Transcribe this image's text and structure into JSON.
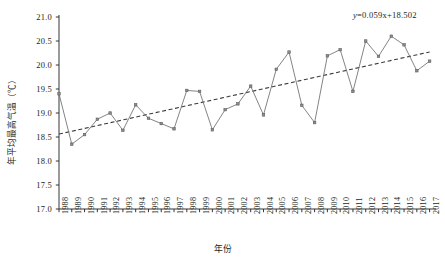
{
  "chart_data": {
    "type": "line",
    "title": "",
    "xlabel": "年份",
    "ylabel": "年平均最高气温（℃）",
    "ylim": [
      17.0,
      21.0
    ],
    "yticks": [
      "17.0",
      "17.5",
      "18.0",
      "18.5",
      "19.0",
      "19.5",
      "20.0",
      "20.5",
      "21.0"
    ],
    "ytick_values": [
      17.0,
      17.5,
      18.0,
      18.5,
      19.0,
      19.5,
      20.0,
      20.5,
      21.0
    ],
    "grid": false,
    "legend": false,
    "annotations": [
      {
        "name": "trend-equation",
        "text": "y=0.059x+18.502",
        "slope": 0.059,
        "intercept": 18.502
      }
    ],
    "categories": [
      "1988",
      "1989",
      "1990",
      "1991",
      "1992",
      "1993",
      "1994",
      "1995",
      "1996",
      "1997",
      "1998",
      "1999",
      "2000",
      "2001",
      "2002",
      "2003",
      "2004",
      "2005",
      "2006",
      "2007",
      "2008",
      "2009",
      "2010",
      "2011",
      "2012",
      "2013",
      "2014",
      "2015",
      "2016",
      "2017"
    ],
    "series": [
      {
        "name": "年平均最高气温",
        "color": "#6e6e6e",
        "marker": "square",
        "values": [
          19.4,
          18.35,
          18.55,
          18.87,
          19.0,
          18.64,
          19.17,
          18.89,
          18.78,
          18.67,
          19.47,
          19.45,
          18.65,
          19.07,
          19.19,
          19.56,
          18.96,
          19.91,
          20.27,
          19.16,
          18.8,
          20.19,
          20.32,
          19.45,
          20.5,
          20.18,
          20.6,
          20.42,
          19.88,
          20.08
        ]
      },
      {
        "name": "线性趋势线",
        "color": "#333333",
        "style": "dashed",
        "values": [
          18.561,
          18.62,
          18.679,
          18.738,
          18.797,
          18.856,
          18.915,
          18.974,
          19.033,
          19.092,
          19.151,
          19.21,
          19.269,
          19.328,
          19.387,
          19.446,
          19.505,
          19.564,
          19.623,
          19.682,
          19.741,
          19.8,
          19.859,
          19.918,
          19.977,
          20.036,
          20.095,
          20.154,
          20.213,
          20.272
        ]
      }
    ]
  },
  "colors": {
    "axis": "#231f20",
    "data_line": "#6e6e6e",
    "trend_line": "#3a3a3a",
    "background": "#ffffff"
  }
}
